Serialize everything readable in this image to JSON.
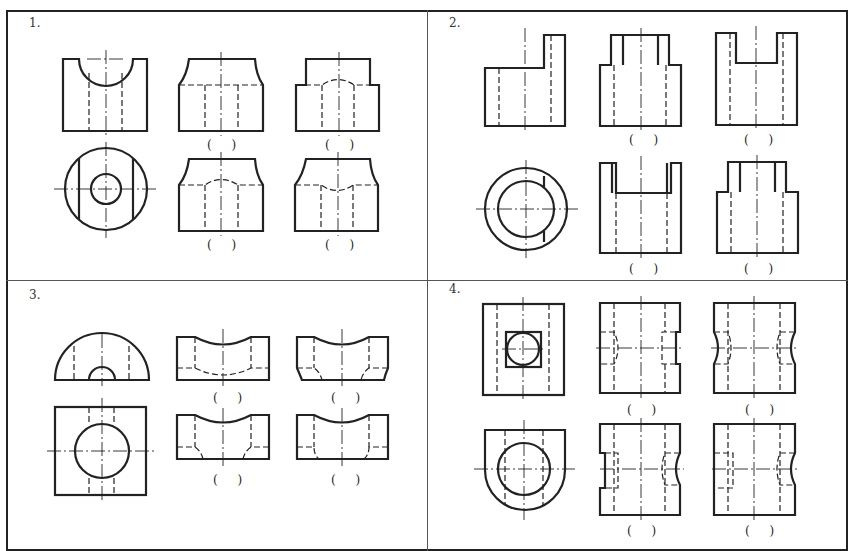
{
  "header": {
    "cut_off_text": ""
  },
  "problems": [
    {
      "number": "1.",
      "option_labels": [
        "( )",
        "( )",
        "( )",
        "( )"
      ]
    },
    {
      "number": "2.",
      "option_labels": [
        "( )",
        "( )",
        "( )",
        "( )"
      ]
    },
    {
      "number": "3.",
      "option_labels": [
        "( )",
        "( )",
        "( )",
        "( )"
      ]
    },
    {
      "number": "4.",
      "option_labels": [
        "( )",
        "( )",
        "( )",
        "( )"
      ]
    }
  ],
  "colors": {
    "line": "#222222",
    "divider": "#555555"
  }
}
